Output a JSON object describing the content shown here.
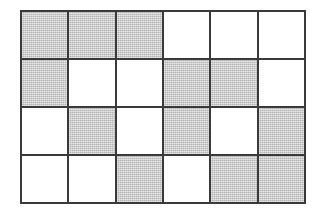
{
  "figure": {
    "type": "grid",
    "rows": 4,
    "columns": 6,
    "background_color": "#ffffff",
    "border_color": "#3a3a3a",
    "shaded_color": "#c9c9c9",
    "empty_color": "#ffffff",
    "shaded_count": 12,
    "empty_count": 12,
    "total_cells": 24,
    "legend": {
      "shaded_label": "shaded",
      "empty_label": "empty"
    },
    "cells": [
      {
        "row": 1,
        "col": 1,
        "state": "shaded"
      },
      {
        "row": 1,
        "col": 2,
        "state": "shaded"
      },
      {
        "row": 1,
        "col": 3,
        "state": "shaded"
      },
      {
        "row": 1,
        "col": 4,
        "state": "empty"
      },
      {
        "row": 1,
        "col": 5,
        "state": "empty"
      },
      {
        "row": 1,
        "col": 6,
        "state": "empty"
      },
      {
        "row": 2,
        "col": 1,
        "state": "shaded"
      },
      {
        "row": 2,
        "col": 2,
        "state": "empty"
      },
      {
        "row": 2,
        "col": 3,
        "state": "empty"
      },
      {
        "row": 2,
        "col": 4,
        "state": "shaded"
      },
      {
        "row": 2,
        "col": 5,
        "state": "shaded"
      },
      {
        "row": 2,
        "col": 6,
        "state": "empty"
      },
      {
        "row": 3,
        "col": 1,
        "state": "empty"
      },
      {
        "row": 3,
        "col": 2,
        "state": "shaded"
      },
      {
        "row": 3,
        "col": 3,
        "state": "empty"
      },
      {
        "row": 3,
        "col": 4,
        "state": "shaded"
      },
      {
        "row": 3,
        "col": 5,
        "state": "empty"
      },
      {
        "row": 3,
        "col": 6,
        "state": "shaded"
      },
      {
        "row": 4,
        "col": 1,
        "state": "empty"
      },
      {
        "row": 4,
        "col": 2,
        "state": "empty"
      },
      {
        "row": 4,
        "col": 3,
        "state": "shaded"
      },
      {
        "row": 4,
        "col": 4,
        "state": "empty"
      },
      {
        "row": 4,
        "col": 5,
        "state": "shaded"
      },
      {
        "row": 4,
        "col": 6,
        "state": "shaded"
      }
    ]
  }
}
